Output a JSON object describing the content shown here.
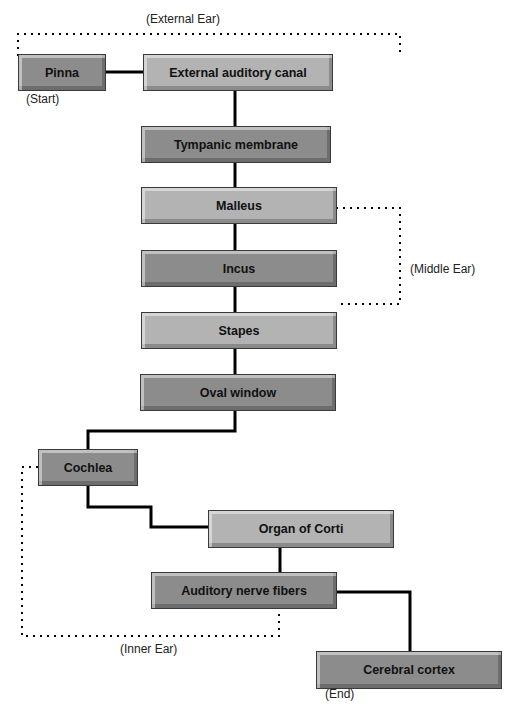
{
  "diagram": {
    "nodes": [
      {
        "id": "pinna",
        "label": "Pinna"
      },
      {
        "id": "canal",
        "label": "External auditory canal"
      },
      {
        "id": "tympanic",
        "label": "Tympanic membrane"
      },
      {
        "id": "malleus",
        "label": "Malleus"
      },
      {
        "id": "incus",
        "label": "Incus"
      },
      {
        "id": "stapes",
        "label": "Stapes"
      },
      {
        "id": "oval",
        "label": "Oval window"
      },
      {
        "id": "cochlea",
        "label": "Cochlea"
      },
      {
        "id": "corti",
        "label": "Organ of Corti"
      },
      {
        "id": "nerve",
        "label": "Auditory nerve fibers"
      },
      {
        "id": "cortex",
        "label": "Cerebral cortex"
      }
    ],
    "groups": {
      "external": "(External Ear)",
      "middle": "(Middle Ear)",
      "inner": "(Inner Ear)"
    },
    "markers": {
      "start": "(Start)",
      "end": "(End)"
    },
    "edges": [
      [
        "pinna",
        "canal"
      ],
      [
        "canal",
        "tympanic"
      ],
      [
        "tympanic",
        "malleus"
      ],
      [
        "malleus",
        "incus"
      ],
      [
        "incus",
        "stapes"
      ],
      [
        "stapes",
        "oval"
      ],
      [
        "oval",
        "cochlea"
      ],
      [
        "cochlea",
        "corti"
      ],
      [
        "corti",
        "nerve"
      ],
      [
        "nerve",
        "cortex"
      ]
    ],
    "colors": {
      "light_box": "#b3b3b3",
      "dark_box": "#8c8c8c",
      "line": "#000000"
    }
  }
}
